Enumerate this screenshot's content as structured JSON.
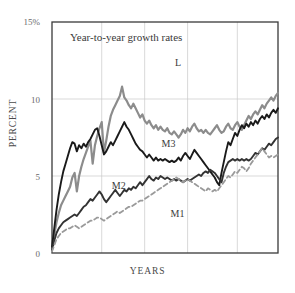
{
  "chart_data": {
    "type": "line",
    "title": "Year-to-year growth rates",
    "xlabel": "YEARS",
    "ylabel": "PERCENT",
    "ylim": [
      0,
      15
    ],
    "xlim": [
      0,
      100
    ],
    "grid": true,
    "legend_position": "inline-labels",
    "ytick_labels": [
      "15%",
      "10",
      "5",
      "0"
    ],
    "ytick_values": [
      15,
      10,
      5,
      0
    ],
    "gridlines_y": [
      10,
      5
    ],
    "gridlines_x": [
      22,
      41,
      60,
      82
    ],
    "colors": {
      "L": "#8c8c8c",
      "M3": "#1a1a1a",
      "M2": "#333333",
      "M1": "#9a9a9a",
      "axis": "#3a3a3a",
      "grid": "#c8c8c8",
      "text": "#3a3a3a"
    },
    "series": [
      {
        "name": "L",
        "style": "solid",
        "width": 2.2,
        "color": "#8c8c8c",
        "label_x": 58,
        "label_y": 12.3,
        "x": [
          0,
          1,
          2,
          3,
          4,
          5,
          6,
          7,
          8,
          9,
          10,
          11,
          12,
          13,
          14,
          15,
          16,
          17,
          18,
          19,
          20,
          21,
          22,
          23,
          24,
          25,
          26,
          27,
          28,
          29,
          30,
          31,
          32,
          33,
          34,
          35,
          36,
          37,
          38,
          39,
          40,
          41,
          42,
          43,
          44,
          45,
          46,
          47,
          48,
          49,
          50,
          51,
          52,
          53,
          54,
          55,
          56,
          57,
          58,
          59,
          60,
          61,
          62,
          63,
          64,
          65,
          66,
          67,
          68,
          69,
          70,
          71,
          72,
          73,
          74,
          75,
          76,
          77,
          78,
          79,
          80,
          81,
          82,
          83,
          84,
          85,
          86,
          87,
          88,
          89,
          90,
          91,
          92,
          93,
          94,
          95,
          96,
          97,
          98,
          99,
          100
        ],
        "values": [
          0.3,
          1.2,
          2.0,
          2.6,
          3.1,
          3.4,
          3.7,
          4.0,
          4.3,
          4.9,
          5.2,
          4.0,
          5.0,
          5.6,
          6.1,
          6.5,
          6.9,
          7.3,
          5.8,
          7.0,
          7.6,
          8.1,
          8.5,
          6.5,
          7.3,
          8.2,
          8.9,
          9.3,
          9.6,
          9.9,
          10.2,
          10.8,
          10.1,
          9.9,
          9.6,
          9.4,
          9.7,
          9.4,
          9.1,
          8.8,
          9.0,
          8.6,
          8.4,
          8.6,
          8.3,
          8.1,
          8.3,
          8.0,
          8.2,
          8.0,
          7.9,
          8.1,
          7.8,
          7.7,
          7.9,
          7.7,
          7.5,
          7.7,
          8.0,
          7.8,
          8.1,
          7.9,
          8.2,
          8.4,
          8.1,
          7.9,
          8.0,
          7.8,
          8.0,
          7.8,
          7.7,
          7.9,
          8.1,
          8.3,
          8.0,
          7.8,
          7.9,
          8.2,
          8.4,
          8.1,
          8.0,
          8.3,
          8.5,
          8.2,
          8.0,
          8.3,
          8.6,
          8.9,
          8.7,
          9.0,
          9.2,
          9.0,
          9.3,
          9.6,
          9.4,
          9.7,
          9.9,
          10.1,
          9.9,
          10.2,
          10.4
        ]
      },
      {
        "name": "M3",
        "style": "solid",
        "width": 1.9,
        "color": "#1a1a1a",
        "label_x": 52,
        "label_y": 7.0,
        "x": [
          0,
          1,
          2,
          3,
          4,
          5,
          6,
          7,
          8,
          9,
          10,
          11,
          12,
          13,
          14,
          15,
          16,
          17,
          18,
          19,
          20,
          21,
          22,
          23,
          24,
          25,
          26,
          27,
          28,
          29,
          30,
          31,
          32,
          33,
          34,
          35,
          36,
          37,
          38,
          39,
          40,
          41,
          42,
          43,
          44,
          45,
          46,
          47,
          48,
          49,
          50,
          51,
          52,
          53,
          54,
          55,
          56,
          57,
          58,
          59,
          60,
          61,
          62,
          63,
          64,
          65,
          66,
          67,
          68,
          69,
          70,
          71,
          72,
          73,
          74,
          75,
          76,
          77,
          78,
          79,
          80,
          81,
          82,
          83,
          84,
          85,
          86,
          87,
          88,
          89,
          90,
          91,
          92,
          93,
          94,
          95,
          96,
          97,
          98,
          99,
          100
        ],
        "values": [
          0.4,
          1.6,
          2.8,
          3.8,
          4.6,
          5.3,
          5.8,
          6.3,
          6.8,
          7.2,
          7.1,
          6.6,
          7.0,
          6.8,
          7.1,
          6.9,
          7.2,
          7.4,
          7.7,
          8.0,
          8.1,
          7.6,
          7.0,
          6.4,
          6.6,
          6.9,
          7.2,
          7.0,
          7.3,
          7.6,
          7.9,
          8.2,
          8.5,
          8.2,
          8.0,
          7.7,
          7.4,
          7.1,
          6.9,
          6.7,
          6.6,
          6.4,
          6.2,
          6.4,
          6.2,
          6.0,
          6.2,
          6.0,
          6.1,
          6.0,
          6.1,
          6.0,
          5.9,
          6.0,
          5.9,
          6.0,
          6.2,
          6.0,
          6.3,
          6.5,
          6.3,
          6.1,
          6.4,
          6.7,
          6.5,
          6.3,
          6.1,
          5.9,
          5.7,
          5.5,
          5.3,
          5.1,
          4.9,
          4.6,
          4.4,
          5.2,
          5.9,
          6.6,
          7.2,
          7.0,
          7.4,
          7.8,
          7.6,
          8.0,
          8.3,
          8.1,
          8.4,
          8.2,
          8.5,
          8.3,
          8.6,
          8.4,
          8.7,
          8.9,
          8.7,
          9.0,
          8.8,
          9.1,
          9.3,
          9.1,
          9.4
        ]
      },
      {
        "name": "M2",
        "style": "solid",
        "width": 1.9,
        "color": "#333333",
        "label_x": 30,
        "label_y": 4.3,
        "x": [
          0,
          1,
          2,
          3,
          4,
          5,
          6,
          7,
          8,
          9,
          10,
          11,
          12,
          13,
          14,
          15,
          16,
          17,
          18,
          19,
          20,
          21,
          22,
          23,
          24,
          25,
          26,
          27,
          28,
          29,
          30,
          31,
          32,
          33,
          34,
          35,
          36,
          37,
          38,
          39,
          40,
          41,
          42,
          43,
          44,
          45,
          46,
          47,
          48,
          49,
          50,
          51,
          52,
          53,
          54,
          55,
          56,
          57,
          58,
          59,
          60,
          61,
          62,
          63,
          64,
          65,
          66,
          67,
          68,
          69,
          70,
          71,
          72,
          73,
          74,
          75,
          76,
          77,
          78,
          79,
          80,
          81,
          82,
          83,
          84,
          85,
          86,
          87,
          88,
          89,
          90,
          91,
          92,
          93,
          94,
          95,
          96,
          97,
          98,
          99,
          100
        ],
        "values": [
          0.2,
          0.8,
          1.3,
          1.6,
          1.8,
          2.0,
          2.1,
          2.2,
          2.3,
          2.4,
          2.5,
          2.4,
          2.6,
          2.8,
          3.0,
          3.1,
          3.3,
          3.5,
          3.4,
          3.6,
          3.8,
          4.0,
          3.8,
          3.5,
          3.3,
          3.5,
          3.7,
          3.9,
          4.1,
          3.9,
          3.7,
          3.9,
          4.1,
          4.0,
          4.2,
          4.1,
          4.3,
          4.2,
          4.4,
          4.6,
          4.4,
          4.6,
          4.8,
          5.0,
          4.8,
          4.7,
          4.9,
          4.8,
          5.0,
          4.9,
          4.8,
          4.9,
          4.8,
          4.7,
          4.8,
          4.7,
          4.8,
          4.7,
          4.6,
          4.7,
          4.8,
          4.7,
          4.8,
          4.9,
          5.0,
          5.1,
          5.0,
          5.2,
          5.3,
          5.2,
          5.4,
          5.3,
          5.2,
          5.0,
          4.8,
          4.6,
          5.2,
          5.6,
          5.9,
          6.0,
          6.1,
          6.0,
          6.1,
          6.0,
          6.1,
          6.0,
          6.1,
          6.0,
          6.1,
          6.3,
          6.5,
          6.4,
          6.6,
          6.8,
          6.7,
          6.9,
          7.1,
          7.0,
          7.2,
          7.4,
          7.5
        ]
      },
      {
        "name": "M1",
        "style": "dashed",
        "width": 1.8,
        "color": "#9a9a9a",
        "label_x": 56,
        "label_y": 2.5,
        "x": [
          0,
          1,
          2,
          3,
          4,
          5,
          6,
          7,
          8,
          9,
          10,
          11,
          12,
          13,
          14,
          15,
          16,
          17,
          18,
          19,
          20,
          21,
          22,
          23,
          24,
          25,
          26,
          27,
          28,
          29,
          30,
          31,
          32,
          33,
          34,
          35,
          36,
          37,
          38,
          39,
          40,
          41,
          42,
          43,
          44,
          45,
          46,
          47,
          48,
          49,
          50,
          51,
          52,
          53,
          54,
          55,
          56,
          57,
          58,
          59,
          60,
          61,
          62,
          63,
          64,
          65,
          66,
          67,
          68,
          69,
          70,
          71,
          72,
          73,
          74,
          75,
          76,
          77,
          78,
          79,
          80,
          81,
          82,
          83,
          84,
          85,
          86,
          87,
          88,
          89,
          90,
          91,
          92,
          93,
          94,
          95,
          96,
          97,
          98,
          99,
          100
        ],
        "values": [
          0.1,
          0.5,
          0.9,
          1.1,
          1.3,
          1.4,
          1.5,
          1.6,
          1.6,
          1.7,
          1.8,
          1.7,
          1.6,
          1.7,
          1.8,
          1.9,
          2.0,
          2.1,
          2.1,
          2.2,
          2.3,
          2.3,
          2.2,
          2.1,
          2.2,
          2.3,
          2.4,
          2.5,
          2.6,
          2.7,
          2.6,
          2.7,
          2.8,
          2.9,
          3.0,
          3.0,
          3.1,
          3.2,
          3.3,
          3.4,
          3.4,
          3.5,
          3.6,
          3.7,
          3.8,
          3.9,
          4.0,
          4.1,
          4.2,
          4.3,
          4.4,
          4.5,
          4.6,
          4.7,
          4.8,
          4.9,
          4.8,
          4.7,
          4.6,
          4.7,
          4.8,
          4.7,
          4.6,
          4.5,
          4.4,
          4.3,
          4.2,
          4.1,
          4.0,
          4.2,
          4.1,
          4.0,
          4.1,
          4.0,
          4.2,
          4.4,
          4.6,
          4.8,
          5.0,
          4.9,
          5.1,
          5.3,
          5.2,
          5.4,
          5.6,
          5.5,
          5.3,
          5.5,
          5.8,
          6.0,
          6.2,
          6.4,
          6.6,
          6.8,
          6.6,
          6.4,
          6.2,
          6.3,
          6.2,
          6.3,
          6.4
        ]
      }
    ]
  },
  "axis": {
    "ytick_0": "0",
    "ytick_5": "5",
    "ytick_10": "10",
    "ytick_15": "15%",
    "xlabel": "YEARS",
    "ylabel": "PERCENT"
  },
  "labels": {
    "title": "Year-to-year growth rates",
    "L": "L",
    "M3": "M3",
    "M2": "M2",
    "M1": "M1"
  }
}
